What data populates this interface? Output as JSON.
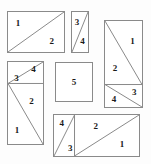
{
  "figure": {
    "background_color": "#fdfdfd",
    "stroke_color": "#8a8a8a",
    "label_color": "#1a1a1a"
  },
  "pieces": [
    {
      "id": "top-left-rectangle",
      "x": 7,
      "y": 11,
      "w": 58,
      "h": 42,
      "diagonal": "bottomleft-to-topright",
      "labels": [
        {
          "text": "1",
          "x": 18,
          "y": 28
        },
        {
          "text": "2",
          "x": 78,
          "y": 72
        }
      ]
    },
    {
      "id": "top-narrow-rectangle",
      "x": 71,
      "y": 11,
      "w": 18,
      "h": 42,
      "diagonal": "bottomleft-to-topright",
      "labels": [
        {
          "text": "3",
          "x": 32,
          "y": 26
        },
        {
          "text": "4",
          "x": 66,
          "y": 72
        }
      ]
    },
    {
      "id": "right-tall-rectangle",
      "x": 104,
      "y": 20,
      "w": 39,
      "h": 88,
      "split": {
        "type": "horizontal",
        "at_percent": 74
      },
      "upper_diagonal": "topleft-to-bottomright",
      "lower_diagonal": "topleft-to-bottomright",
      "labels": [
        {
          "text": "1",
          "x": 74,
          "y": 23
        },
        {
          "text": "2",
          "x": 27,
          "y": 55
        },
        {
          "text": "3",
          "x": 79,
          "y": 82
        },
        {
          "text": "4",
          "x": 24,
          "y": 91
        }
      ]
    },
    {
      "id": "left-tall-rectangle",
      "x": 7,
      "y": 61,
      "w": 37,
      "h": 84,
      "split": {
        "type": "horizontal",
        "at_percent": 26
      },
      "upper_diagonal": "bottomleft-to-topright",
      "lower_diagonal": "topleft-to-bottomright",
      "labels": [
        {
          "text": "3",
          "x": 24,
          "y": 19
        },
        {
          "text": "4",
          "x": 73,
          "y": 9
        },
        {
          "text": "2",
          "x": 67,
          "y": 48
        },
        {
          "text": "1",
          "x": 26,
          "y": 83
        }
      ]
    },
    {
      "id": "center-square",
      "x": 55,
      "y": 62,
      "w": 38,
      "h": 40,
      "diagonal": "none",
      "labels": [
        {
          "text": "5",
          "x": 50,
          "y": 50
        }
      ]
    },
    {
      "id": "bottom-rectangle",
      "x": 53,
      "y": 114,
      "w": 87,
      "h": 43,
      "split": {
        "type": "vertical",
        "at_percent": 24
      },
      "left_diagonal": "bottomleft-to-topright",
      "right_diagonal": "bottomleft-to-topright",
      "labels": [
        {
          "text": "4",
          "x": 9,
          "y": 20
        },
        {
          "text": "3",
          "x": 19,
          "y": 80
        },
        {
          "text": "2",
          "x": 49,
          "y": 27
        },
        {
          "text": "1",
          "x": 80,
          "y": 70
        }
      ]
    }
  ]
}
